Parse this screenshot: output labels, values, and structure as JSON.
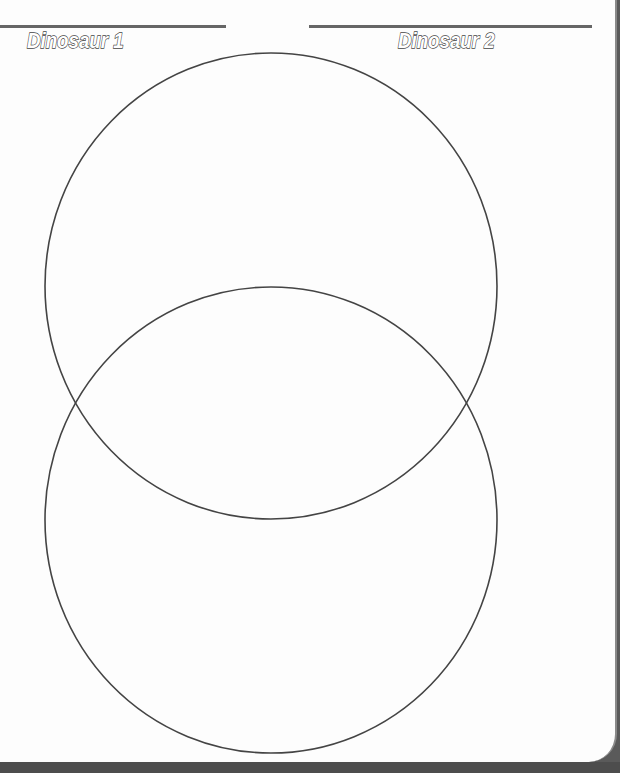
{
  "worksheet": {
    "title_left": "Dinosaur 1",
    "title_right": "Dinosaur 2",
    "circle_stroke_color": "#444444",
    "line_color": "#666666",
    "page_color": "#fdfdfd",
    "background_color": "#5a5a5a"
  },
  "venn": {
    "circles": [
      {
        "name": "Dinosaur 1",
        "cx": 271,
        "cy": 286,
        "rx": 226,
        "ry": 233
      },
      {
        "name": "Dinosaur 2",
        "cx": 271,
        "cy": 520,
        "rx": 226,
        "ry": 233
      }
    ]
  }
}
